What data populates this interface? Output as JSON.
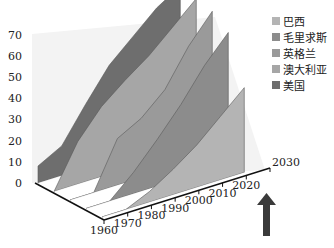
{
  "chart_data": {
    "type": "area",
    "subtype": "3d-ribbon",
    "title": "",
    "xlabel": "",
    "ylabel": "",
    "ylim": [
      0,
      70
    ],
    "xlim": [
      1960,
      2030
    ],
    "y_ticks": [
      "0",
      "10",
      "20",
      "30",
      "40",
      "50",
      "60",
      "70"
    ],
    "x_ticks": [
      "1960",
      "1970",
      "1980",
      "1990",
      "2000",
      "2010",
      "2020",
      "2030"
    ],
    "x": [
      1960,
      1970,
      1980,
      1990,
      2000,
      2010,
      2020
    ],
    "series": [
      {
        "name": "巴西",
        "color": "#b4b4b4",
        "values": [
          0,
          0,
          5,
          12,
          20,
          30,
          40
        ]
      },
      {
        "name": "毛里求斯",
        "color": "#8c8c8c",
        "values": [
          0,
          0,
          10,
          22,
          35,
          50,
          62
        ]
      },
      {
        "name": "英格兰",
        "color": "#9a9a9a",
        "values": [
          0,
          0,
          22,
          28,
          38,
          55,
          68
        ]
      },
      {
        "name": "澳大利亚",
        "color": "#a6a6a6",
        "values": [
          0,
          20,
          33,
          42,
          50,
          60,
          70
        ]
      },
      {
        "name": "美国",
        "color": "#6e6e6e",
        "values": [
          8,
          14,
          30,
          45,
          55,
          65,
          72
        ]
      }
    ],
    "grid": false,
    "legend_position": "top-right",
    "annotations": [
      {
        "type": "arrow",
        "x": 2020,
        "direction": "up",
        "color": "#3a3a3a"
      }
    ]
  },
  "legend": {
    "items": [
      {
        "label": "巴西",
        "color": "#b4b4b4"
      },
      {
        "label": "毛里求斯",
        "color": "#8c8c8c"
      },
      {
        "label": "英格兰",
        "color": "#9a9a9a"
      },
      {
        "label": "澳大利亚",
        "color": "#a6a6a6"
      },
      {
        "label": "美国",
        "color": "#6e6e6e"
      }
    ]
  }
}
